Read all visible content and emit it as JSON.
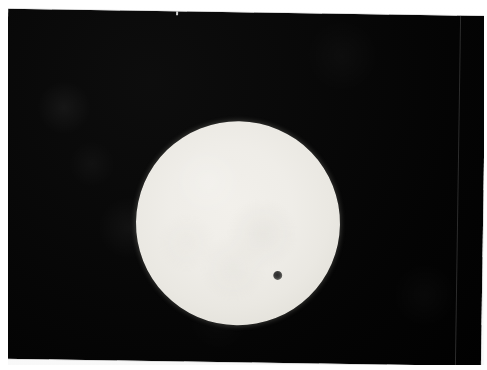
{
  "image": {
    "kind": "photograph",
    "subject": "Transit of Venus across the solar disk",
    "description": "A photographic print, slightly rotated on a white scan background, showing a bright white-yellow solar disk against a black sky with a small dark circular silhouette of Venus in the lower-right quadrant of the Sun.",
    "orientation": "landscape",
    "rotation_degrees": "0.85"
  },
  "scene": {
    "background_label": "white scan background",
    "print_label": "photographic print",
    "sky_label": "black sky",
    "vertical_seam_label": "film seam line",
    "top_nick_label": "print edge nick"
  },
  "objects": {
    "sun": {
      "name": "Sun",
      "shape": "disk",
      "center_x": "241",
      "center_y": "220",
      "radius_px": "102",
      "color_core": "#f1efea",
      "color_limb": "#c6c2b9",
      "limb_darkening": "present"
    },
    "venus": {
      "name": "Venus",
      "shape": "disk",
      "center_x": "281",
      "center_y": "271",
      "radius_px": "4",
      "color": "#2a2a2a",
      "state": "in transit"
    },
    "sky": {
      "name": "Background sky",
      "color": "#050505"
    }
  },
  "colors": {
    "page_background": "#ffffff",
    "photo_black": "#060606",
    "sun_white": "#f1efea",
    "venus_dark": "#2a2a2a",
    "seam_gray": "#3a3a3a"
  }
}
